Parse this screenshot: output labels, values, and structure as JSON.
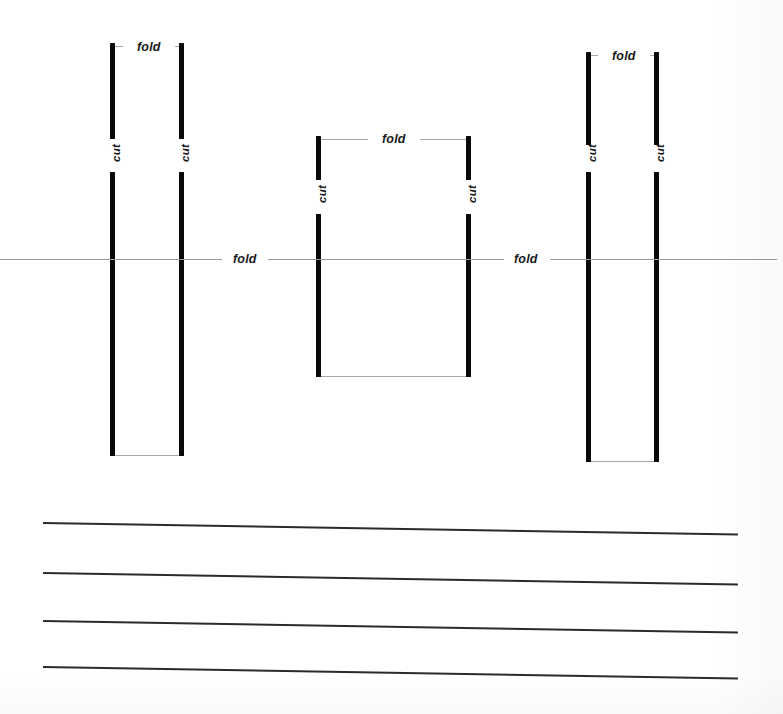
{
  "document": {
    "type": "paper-craft-template",
    "description": "Hand-drawn pop-up card cutting and folding template on lined paper",
    "background_color": "#ffffff",
    "ink_color": "#090909",
    "guide_color": "#a8a8a8",
    "rule_color": "#2b2b2b"
  },
  "labels": {
    "fold": "fold",
    "cut": "cut"
  },
  "groups": [
    {
      "id": "left-bracket",
      "top_fold_label": "fold",
      "left_cut_label": "cut",
      "right_cut_label": "cut",
      "left_bar_x": 110,
      "right_bar_x": 179,
      "bar_width": 5,
      "upper_bar_top": 43,
      "upper_bar_height": 96,
      "lower_bar_top": 172,
      "lower_bar_height": 284,
      "top_guide_y": 46,
      "bottom_guide_y": 455,
      "fold_label_x": 137,
      "fold_label_y": 40,
      "left_cut_label_x": 107,
      "left_cut_label_y": 147,
      "right_cut_label_x": 176,
      "right_cut_label_y": 147
    },
    {
      "id": "middle-bracket",
      "top_fold_label": "fold",
      "left_cut_label": "cut",
      "right_cut_label": "cut",
      "left_bar_x": 316,
      "right_bar_x": 466,
      "bar_width": 5,
      "upper_bar_top": 136,
      "upper_bar_height": 44,
      "lower_bar_top": 214,
      "lower_bar_height": 163,
      "top_guide_y": 139,
      "bottom_guide_y": 376,
      "fold_label_x": 382,
      "fold_label_y": 132,
      "left_cut_label_x": 313,
      "left_cut_label_y": 188,
      "right_cut_label_x": 463,
      "right_cut_label_y": 188
    },
    {
      "id": "right-bracket",
      "top_fold_label": "fold",
      "left_cut_label": "cut",
      "right_cut_label": "cut",
      "left_bar_x": 586,
      "right_bar_x": 654,
      "bar_width": 5,
      "upper_bar_top": 52,
      "upper_bar_height": 93,
      "lower_bar_top": 172,
      "lower_bar_height": 290,
      "top_guide_y": 55,
      "bottom_guide_y": 461,
      "fold_label_x": 612,
      "fold_label_y": 49,
      "left_cut_label_x": 583,
      "left_cut_label_y": 147,
      "right_cut_label_x": 651,
      "right_cut_label_y": 147
    }
  ],
  "horizontal_fold": {
    "label_left": "fold",
    "label_right": "fold",
    "y": 259,
    "x_start": 0,
    "x_end": 777,
    "left_label_x": 233,
    "left_label_y": 252,
    "right_label_x": 514,
    "right_label_y": 252,
    "segments": [
      {
        "x": 0,
        "width": 222
      },
      {
        "x": 268,
        "width": 236
      },
      {
        "x": 550,
        "width": 227
      }
    ]
  },
  "ruled_lines": [
    {
      "index": 1,
      "x": 43,
      "y": 522,
      "width": 695,
      "angle_deg": 0.95
    },
    {
      "index": 2,
      "x": 43,
      "y": 572,
      "width": 695,
      "angle_deg": 0.95
    },
    {
      "index": 3,
      "x": 43,
      "y": 620,
      "width": 695,
      "angle_deg": 0.95
    },
    {
      "index": 4,
      "x": 43,
      "y": 666,
      "width": 695,
      "angle_deg": 0.95
    }
  ]
}
